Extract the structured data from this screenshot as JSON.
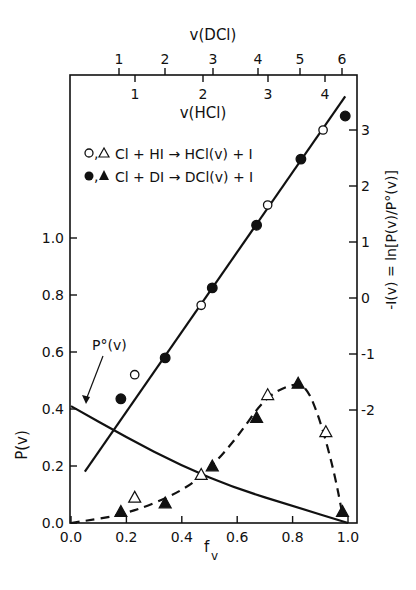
{
  "chart_data": {
    "type": "scatter",
    "title": "",
    "xlabel": "f_v",
    "ylabel_left": "P(v)",
    "ylabel_right": "-I(v) = ln[P(v)/P°(v)]",
    "top_axis_labels": {
      "dcl": "v(DCl)",
      "hcl": "v(HCl)"
    },
    "x_ticks": [
      "0.0",
      "0.2",
      "0.4",
      "0.6",
      "0.8",
      "1.0"
    ],
    "y_left_ticks": [
      "0.0",
      "0.2",
      "0.4",
      "0.6",
      "0.8",
      "1.0"
    ],
    "y_right_ticks": [
      "-2",
      "-1",
      "0",
      "1",
      "2",
      "3"
    ],
    "top_dcl_ticks": [
      "1",
      "2",
      "3",
      "4",
      "5",
      "6"
    ],
    "top_hcl_ticks": [
      "1",
      "2",
      "3",
      "4"
    ],
    "xlim": [
      0,
      1.0
    ],
    "ylim_left": [
      0,
      1.25
    ],
    "ylim_right": [
      -4.0,
      3.7
    ],
    "grid": false,
    "legend": [
      {
        "markers": "○,△",
        "label": "Cl + HI → HCl(v) + I"
      },
      {
        "markers": "●,▲",
        "label": "Cl + DI → DCl(v) + I"
      }
    ],
    "annotations": [
      {
        "text": "P°(v)",
        "target": "prior curve at f_v≈0.05"
      }
    ],
    "series": [
      {
        "name": "HCl P(v) (open triangles)",
        "axis": "left",
        "marker": "open-triangle",
        "x": [
          0.23,
          0.47,
          0.71,
          0.92
        ],
        "y": [
          0.09,
          0.17,
          0.45,
          0.32
        ]
      },
      {
        "name": "DCl P(v) (filled triangles)",
        "axis": "left",
        "marker": "filled-triangle",
        "x": [
          0.18,
          0.34,
          0.51,
          0.67,
          0.82,
          0.98
        ],
        "y": [
          0.04,
          0.07,
          0.2,
          0.37,
          0.49,
          0.04
        ]
      },
      {
        "name": "HCl -I(v) (open circles)",
        "axis": "right",
        "marker": "open-circle",
        "x": [
          0.23,
          0.47,
          0.71,
          0.91
        ],
        "y": [
          -1.37,
          -0.13,
          1.66,
          3.0
        ]
      },
      {
        "name": "DCl -I(v) (filled circles)",
        "axis": "right",
        "marker": "filled-circle",
        "x": [
          0.18,
          0.34,
          0.51,
          0.67,
          0.83,
          0.99
        ],
        "y": [
          -1.8,
          -1.07,
          0.18,
          1.3,
          2.48,
          3.25
        ]
      },
      {
        "name": "Linear surprisal fit",
        "axis": "right",
        "style": "solid-line",
        "x": [
          0.05,
          0.99
        ],
        "y": [
          -3.1,
          3.6
        ]
      },
      {
        "name": "P°(v) prior",
        "axis": "left",
        "style": "solid-curve",
        "x": [
          0.0,
          0.2,
          0.4,
          0.6,
          0.8,
          1.0
        ],
        "y": [
          0.41,
          0.3,
          0.2,
          0.12,
          0.06,
          0.0
        ]
      },
      {
        "name": "P(v) surprisal fit",
        "axis": "left",
        "style": "dashed-curve",
        "x": [
          0.0,
          0.2,
          0.4,
          0.5,
          0.6,
          0.7,
          0.8,
          0.85,
          0.9,
          0.95,
          0.98
        ],
        "y": [
          0.0,
          0.03,
          0.11,
          0.19,
          0.3,
          0.44,
          0.49,
          0.48,
          0.36,
          0.18,
          0.03
        ]
      }
    ]
  }
}
